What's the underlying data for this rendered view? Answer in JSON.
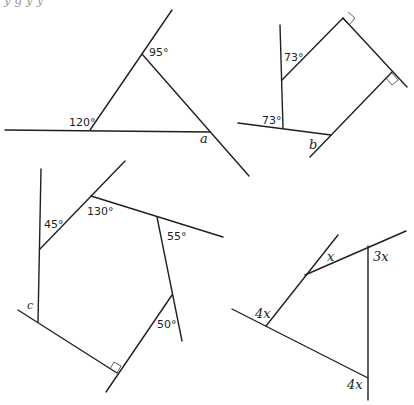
{
  "header": {
    "cropped_text": "y   g      y   y"
  },
  "figures": [
    {
      "id": "triangle-a",
      "labels": {
        "top_angle": "95°",
        "left_angle": "120°",
        "unknown": "a"
      }
    },
    {
      "id": "quadrilateral-b",
      "labels": {
        "upper_angle": "73°",
        "lower_angle": "73°",
        "unknown": "b"
      },
      "right_angles": 2
    },
    {
      "id": "pentagon-c",
      "labels": {
        "angle1": "45°",
        "angle2": "130°",
        "angle3": "55°",
        "angle4": "50°",
        "unknown": "c"
      },
      "right_angles": 1
    },
    {
      "id": "quadrilateral-x",
      "labels": {
        "top_left": "x",
        "top_right": "3x",
        "left": "4x",
        "bottom": "4x"
      }
    }
  ]
}
